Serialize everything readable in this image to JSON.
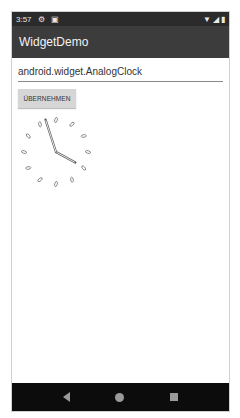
{
  "status_bar": {
    "time": "3:57",
    "left_icons": [
      "gear-icon",
      "notification-icon"
    ],
    "right_icons": [
      "wifi-icon",
      "signal-icon",
      "battery-icon"
    ]
  },
  "app_bar": {
    "title": "WidgetDemo"
  },
  "main": {
    "class_input": {
      "value": "android.widget.AnalogClock"
    },
    "apply_button": {
      "label": "ÜBERNEHMEN"
    },
    "analog_clock": {
      "hours": 3,
      "minutes": 57
    }
  },
  "nav_bar": {
    "buttons": [
      "back",
      "home",
      "recents"
    ]
  }
}
